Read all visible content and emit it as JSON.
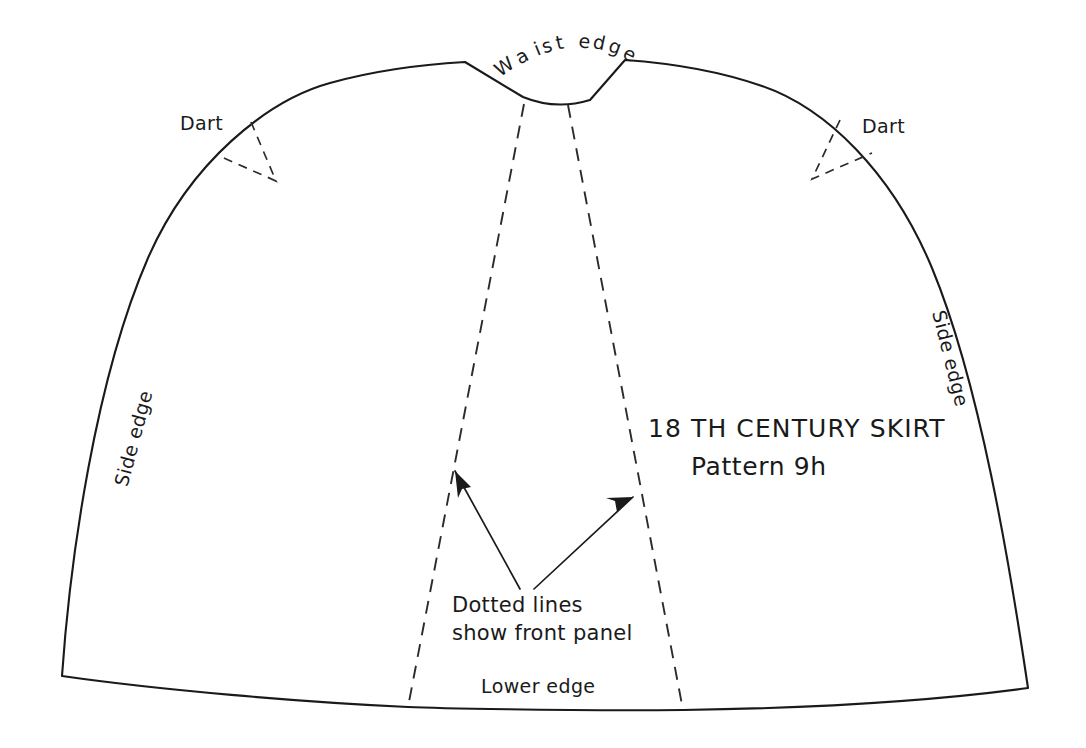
{
  "document": {
    "kind": "sewing-pattern-diagram",
    "title_line_1": "18 TH CENTURY SKIRT",
    "title_line_2": "Pattern 9h",
    "background_color": "#ffffff",
    "ink_color": "#1a1a1a"
  },
  "labels": {
    "waist_edge": "Waist edge",
    "dart_left": "Dart",
    "dart_right": "Dart",
    "side_edge_left": "Side edge",
    "side_edge_right": "Side edge",
    "lower_edge": "Lower edge",
    "caption_line_1": "Dotted lines",
    "caption_line_2": "show front panel"
  },
  "waist_edge_letters": [
    {
      "ch": "W",
      "x": 508,
      "y": 72,
      "rot": -34
    },
    {
      "ch": "a",
      "x": 525,
      "y": 62,
      "rot": -28
    },
    {
      "ch": "i",
      "x": 540,
      "y": 55,
      "rot": -22
    },
    {
      "ch": "s",
      "x": 549,
      "y": 52,
      "rot": -17
    },
    {
      "ch": "t",
      "x": 561,
      "y": 49,
      "rot": -12
    },
    {
      "ch": "e",
      "x": 584,
      "y": 48,
      "rot": 6
    },
    {
      "ch": "d",
      "x": 598,
      "y": 49,
      "rot": 12
    },
    {
      "ch": "g",
      "x": 613,
      "y": 53,
      "rot": 20
    },
    {
      "ch": "e",
      "x": 627,
      "y": 60,
      "rot": 27
    }
  ],
  "geometry": {
    "outline": "M 62 676 C 70 560 95 380 148 258 C 190 162 268 100 330 83 C 380 69 430 64 465 62 L 523 97 C 545 106 567 107 590 100 L 625 60 C 668 63 716 70 762 86 C 826 108 892 172 932 268 C 980 384 1010 566 1028 688 C 940 700 820 708 683 710 C 560 711 430 708 408 707 C 300 702 160 690 62 676 Z",
    "front_panel_left": "M 524 104 L 408 707",
    "front_panel_right": "M 568 105 L 683 710",
    "dart_left": "M 251 122 L 276 181 L 217 155",
    "dart_right": "M 840 120 L 812 179 L 872 153",
    "arrow_left": {
      "x1": 520,
      "y1": 589,
      "x2": 455,
      "y2": 471
    },
    "arrow_right": {
      "x1": 534,
      "y1": 589,
      "x2": 633,
      "y2": 497
    },
    "arrow_head_left": "M 455 471 L 471 487 L 462 489 L 458 498 Z",
    "arrow_head_right": "M 633 497 L 617 512 L 615 501 L 606 498 Z"
  },
  "text_positions": {
    "dart_left": {
      "x": 180,
      "y": 130
    },
    "dart_right": {
      "x": 862,
      "y": 133
    },
    "side_edge_left": {
      "x": 140,
      "y": 440,
      "rot": -75
    },
    "side_edge_right": {
      "x": 944,
      "y": 360,
      "rot": 76
    },
    "lower_edge": {
      "x": 481,
      "y": 693
    },
    "title_1": {
      "x": 648,
      "y": 437
    },
    "title_2": {
      "x": 691,
      "y": 475
    },
    "caption_1": {
      "x": 452,
      "y": 612
    },
    "caption_2": {
      "x": 452,
      "y": 640
    }
  }
}
